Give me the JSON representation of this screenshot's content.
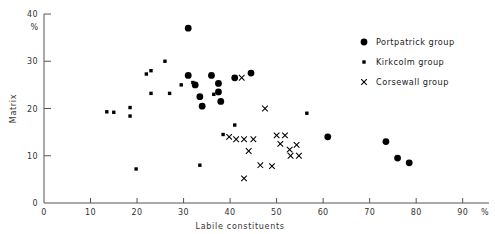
{
  "chart_data": {
    "type": "scatter",
    "title": "",
    "xlabel": "Labile constituents",
    "ylabel": "Matrix",
    "x_unit": "%",
    "y_unit": "%",
    "xlim": [
      0,
      92
    ],
    "ylim": [
      0,
      40
    ],
    "xticks": [
      0,
      10,
      20,
      30,
      40,
      50,
      60,
      70,
      80,
      90
    ],
    "yticks": [
      0,
      10,
      20,
      30,
      40
    ],
    "xticklabels": [
      "0",
      "10",
      "20",
      "30",
      "40",
      "50",
      "60",
      "70",
      "80",
      "90"
    ],
    "yticklabels": [
      "0",
      "10",
      "20",
      "30",
      "40"
    ],
    "grid": false,
    "legend_position": "upper-right",
    "series": [
      {
        "name": "Portpatrick group",
        "marker": "filled-circle-large",
        "color": "#000000",
        "points": [
          [
            31.0,
            37.0
          ],
          [
            31.0,
            27.0
          ],
          [
            32.5,
            25.0
          ],
          [
            33.5,
            22.5
          ],
          [
            34.0,
            20.5
          ],
          [
            36.0,
            27.0
          ],
          [
            37.5,
            25.3
          ],
          [
            37.5,
            23.5
          ],
          [
            38.0,
            21.5
          ],
          [
            41.0,
            26.5
          ],
          [
            44.5,
            27.5
          ],
          [
            61.0,
            14.0
          ],
          [
            73.5,
            13.0
          ],
          [
            76.0,
            9.5
          ],
          [
            78.5,
            8.5
          ]
        ]
      },
      {
        "name": "Kirkcolm group",
        "marker": "filled-square-small",
        "color": "#000000",
        "points": [
          [
            13.5,
            19.3
          ],
          [
            15.0,
            19.2
          ],
          [
            18.5,
            20.2
          ],
          [
            18.5,
            18.4
          ],
          [
            19.8,
            7.2
          ],
          [
            22.0,
            27.3
          ],
          [
            23.0,
            28.0
          ],
          [
            23.0,
            23.2
          ],
          [
            26.0,
            30.0
          ],
          [
            27.0,
            23.2
          ],
          [
            29.5,
            25.0
          ],
          [
            32.0,
            25.5
          ],
          [
            33.5,
            8.0
          ],
          [
            36.5,
            23.0
          ],
          [
            41.0,
            16.5
          ],
          [
            38.5,
            14.5
          ],
          [
            56.5,
            19.0
          ]
        ]
      },
      {
        "name": "Corsewall group",
        "marker": "cross",
        "color": "#000000",
        "points": [
          [
            42.5,
            26.5
          ],
          [
            47.5,
            20.0
          ],
          [
            39.8,
            14.0
          ],
          [
            41.3,
            13.5
          ],
          [
            43.0,
            13.5
          ],
          [
            45.0,
            13.5
          ],
          [
            44.0,
            11.0
          ],
          [
            43.0,
            5.2
          ],
          [
            46.5,
            8.0
          ],
          [
            50.0,
            14.3
          ],
          [
            51.8,
            14.3
          ],
          [
            50.8,
            12.5
          ],
          [
            52.8,
            11.3
          ],
          [
            54.3,
            12.3
          ],
          [
            53.0,
            10.0
          ],
          [
            54.8,
            10.0
          ],
          [
            49.0,
            7.8
          ]
        ]
      }
    ],
    "legend": [
      {
        "label": "Portpatrick group",
        "marker": "filled-circle-large"
      },
      {
        "label": "Kirkcolm group",
        "marker": "filled-square-small"
      },
      {
        "label": "Corsewall group",
        "marker": "cross"
      }
    ]
  }
}
